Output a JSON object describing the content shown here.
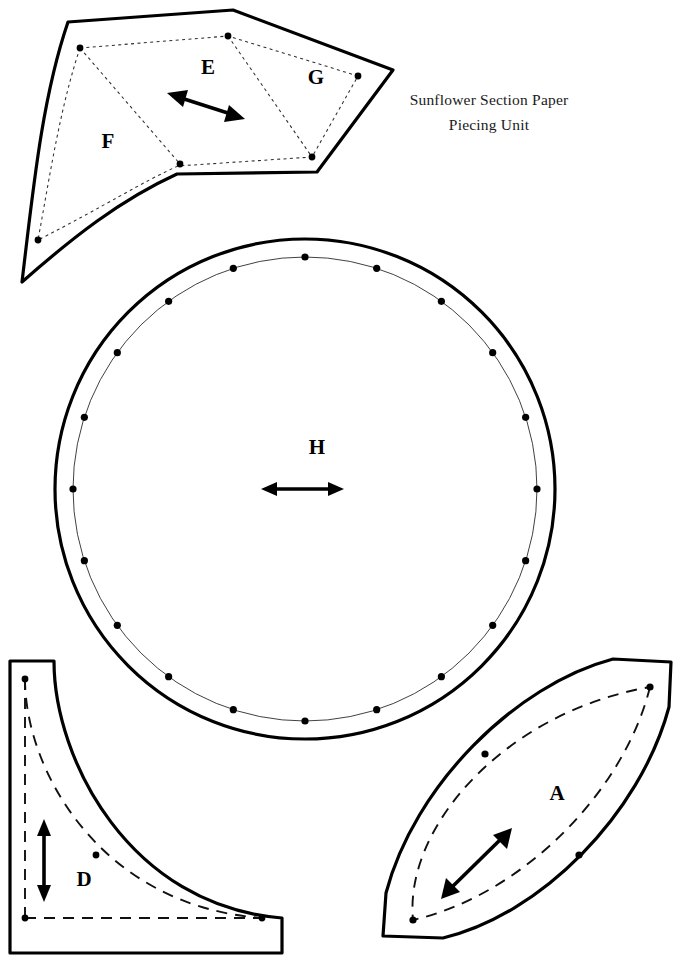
{
  "document": {
    "kind": "quilt-pattern-template-sheet",
    "title_line_1": "Sunflower Section Paper",
    "title_line_2": "Piecing Unit",
    "background_color": "#ffffff",
    "ink_color": "#000000",
    "width": 681,
    "height": 968
  },
  "pieces": [
    {
      "id": "efg-unit",
      "label_group": "Sunflower Section Paper Piecing Unit",
      "description": "Curved wedge outer cutting shape containing three paper-pieced subsections",
      "subsections": [
        {
          "label": "E",
          "label_x": 208,
          "label_y": 69
        },
        {
          "label": "F",
          "label_x": 108,
          "label_y": 143
        },
        {
          "label": "G",
          "label_x": 316,
          "label_y": 79
        }
      ],
      "grain_arrow": {
        "label": "grain-line-arrow",
        "direction": "diagonal-up-left-down-right",
        "x1": 240,
        "y1": 118,
        "x2": 172,
        "y2": 94
      },
      "seam_dot_count": 6
    },
    {
      "id": "h-circle",
      "label": "H",
      "label_x": 317,
      "label_y": 449,
      "description": "Large circle centre piece with marked seam circle and twenty registration dots",
      "center_x": 305,
      "center_y": 489,
      "outer_radius": 250,
      "seam_radius": 232,
      "dot_count": 20,
      "grain_arrow": {
        "label": "grain-line-arrow",
        "direction": "horizontal",
        "x1": 265,
        "y1": 489,
        "x2": 340,
        "y2": 489
      }
    },
    {
      "id": "d-corner",
      "label": "D",
      "label_x": 84,
      "label_y": 881,
      "description": "L-shaped concave corner piece with dashed seam allowance line",
      "grain_arrow": {
        "label": "grain-line-arrow",
        "direction": "vertical",
        "x1": 44,
        "y1": 820,
        "x2": 44,
        "y2": 900
      },
      "seam_dot_count": 4
    },
    {
      "id": "a-petal",
      "label": "A",
      "label_x": 557,
      "label_y": 795,
      "description": "Pointed leaf / petal shape with dashed seam allowance line",
      "grain_arrow": {
        "label": "grain-line-arrow",
        "direction": "diagonal-up-right-down-left",
        "x1": 440,
        "y1": 898,
        "x2": 497,
        "y2": 842
      },
      "seam_dot_count": 4
    }
  ],
  "legend": {
    "solid_line_meaning": "cutting line",
    "dashed_line_meaning": "seam line",
    "dot_meaning": "match point",
    "arrow_meaning": "grain line"
  }
}
